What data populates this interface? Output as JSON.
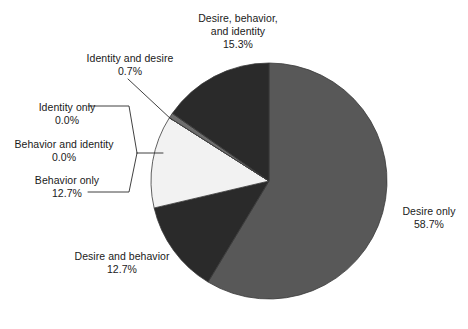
{
  "chart_data": {
    "type": "pie",
    "title": "",
    "subtitle": "",
    "xlabel": "",
    "ylabel": "",
    "legend_position": "none",
    "grid": false,
    "start_angle_deg": 0,
    "direction": "clockwise",
    "units": "percent",
    "total": 100.1,
    "categories": [
      "Desire only",
      "Desire and behavior",
      "Behavior only",
      "Behavior and identity",
      "Identity only",
      "Identity and desire",
      "Desire, behavior, and identity"
    ],
    "values": [
      58.7,
      12.7,
      12.7,
      0.0,
      0.0,
      0.7,
      15.3
    ],
    "value_labels": [
      "58.7%",
      "12.7%",
      "12.7%",
      "0.0%",
      "0.0%",
      "0.7%",
      "15.3%"
    ],
    "colors": [
      "#585858",
      "#2a2a2a",
      "#f2f2f2",
      "#f2f2f2",
      "#f2f2f2",
      "#6e6e6e",
      "#2a2a2a"
    ],
    "slices": [
      {
        "name": "Desire only",
        "value": 58.7,
        "value_label": "58.7%",
        "color": "#585858"
      },
      {
        "name": "Desire and behavior",
        "value": 12.7,
        "value_label": "12.7%",
        "color": "#2a2a2a"
      },
      {
        "name": "Behavior only",
        "value": 12.7,
        "value_label": "12.7%",
        "color": "#f2f2f2"
      },
      {
        "name": "Behavior and identity",
        "value": 0.0,
        "value_label": "0.0%",
        "color": "#f2f2f2"
      },
      {
        "name": "Identity only",
        "value": 0.0,
        "value_label": "0.0%",
        "color": "#f2f2f2"
      },
      {
        "name": "Identity and desire",
        "value": 0.7,
        "value_label": "0.7%",
        "color": "#6e6e6e"
      },
      {
        "name": "Desire, behavior, and identity",
        "value": 15.3,
        "value_label": "15.3%",
        "color": "#2a2a2a"
      }
    ]
  },
  "labels": {
    "desire_behavior_identity": {
      "line1": "Desire, behavior,",
      "line2": "and identity",
      "pct": "15.3%"
    },
    "identity_and_desire": {
      "name": "Identity and desire",
      "pct": "0.7%"
    },
    "identity_only": {
      "name": "Identity only",
      "pct": "0.0%"
    },
    "behavior_and_identity": {
      "name": "Behavior and identity",
      "pct": "0.0%"
    },
    "behavior_only": {
      "name": "Behavior only",
      "pct": "12.7%"
    },
    "desire_and_behavior": {
      "name": "Desire and behavior",
      "pct": "12.7%"
    },
    "desire_only": {
      "name": "Desire only",
      "pct": "58.7%"
    }
  },
  "style": {
    "background": "#ffffff",
    "text_color": "#1a1a1a",
    "leader_line_color": "#2b2b2b",
    "slice_outline": "#3a3a3a"
  }
}
